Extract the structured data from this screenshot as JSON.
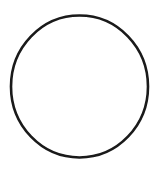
{
  "figure": {
    "shape": "circle-outline",
    "stroke_color": "#1a1a1a",
    "fill_color": "#ffffff",
    "background": "#ffffff"
  }
}
